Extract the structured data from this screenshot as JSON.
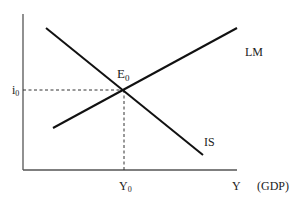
{
  "diagram": {
    "type": "IS-LM diagram",
    "axes": {
      "x_label": "Y",
      "x_unit_label": "(GDP)",
      "y_label": ""
    },
    "curves": {
      "is": {
        "label": "IS",
        "slope": "downward"
      },
      "lm": {
        "label": "LM",
        "slope": "upward"
      }
    },
    "equilibrium": {
      "label": "E",
      "label_sub": "0",
      "interest_label": "i",
      "interest_sub": "0",
      "output_label": "Y",
      "output_sub": "0"
    },
    "colors": {
      "line": "#111111",
      "axis": "#555555",
      "dash": "#333333",
      "text": "#222222"
    }
  }
}
